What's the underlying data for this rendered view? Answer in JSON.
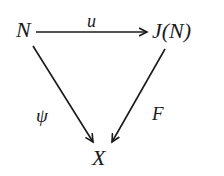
{
  "nodes": {
    "source": "N",
    "target": "J(N)",
    "bottom": "X"
  },
  "arrows": {
    "top": {
      "from": "N",
      "to": "J(N)",
      "label": "u"
    },
    "left": {
      "from": "N",
      "to": "X",
      "label": "ψ"
    },
    "right": {
      "from": "J(N)",
      "to": "X",
      "label": "F"
    }
  },
  "colors": {
    "ink": "#1a1a1a",
    "background": "#ffffff"
  }
}
